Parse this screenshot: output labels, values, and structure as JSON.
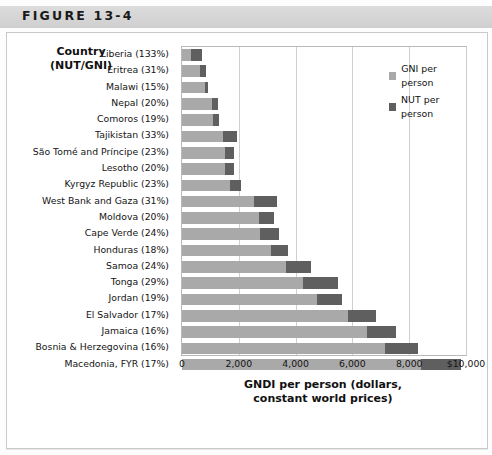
{
  "figure": {
    "label": "FIGURE 13-4"
  },
  "row_header": {
    "line1": "Country",
    "line2": "(NUT/GNI)"
  },
  "legend": {
    "items": [
      {
        "label": "GNI per person",
        "color": "#a9a9a9"
      },
      {
        "label": "NUT per person",
        "color": "#5f5f5f"
      }
    ]
  },
  "axis": {
    "title_line1": "GNDI per person (dollars,",
    "title_line2": "constant world prices)",
    "ticks": [
      "0",
      "2,000",
      "4,000",
      "6,000",
      "8,000",
      "$10,000"
    ]
  },
  "chart_data": {
    "type": "bar",
    "orientation": "horizontal",
    "stacked": true,
    "title": "FIGURE 13-4",
    "xlabel": "GNDI per person (dollars, constant world prices)",
    "ylabel": "Country (NUT/GNI)",
    "xlim": [
      0,
      10000
    ],
    "xticks": [
      0,
      2000,
      4000,
      6000,
      8000,
      10000
    ],
    "xticklabels": [
      "0",
      "2,000",
      "4,000",
      "6,000",
      "8,000",
      "$10,000"
    ],
    "grid": true,
    "legend_position": "top-right",
    "categories": [
      "Liberia (133%)",
      "Eritrea (31%)",
      "Malawi (15%)",
      "Nepal (20%)",
      "Comoros (19%)",
      "Tajikistan (33%)",
      "São Tomé and Príncipe (23%)",
      "Lesotho (20%)",
      "Kyrgyz Republic (23%)",
      "West Bank and Gaza (31%)",
      "Moldova (20%)",
      "Cape Verde (24%)",
      "Honduras (18%)",
      "Samoa (24%)",
      "Tonga (29%)",
      "Jordan (19%)",
      "El Salvador (17%)",
      "Jamaica (16%)",
      "Bosnia & Herzegovina (16%)",
      "Macedonia, FYR (17%)"
    ],
    "series": [
      {
        "name": "GNI per person",
        "color": "#a9a9a9",
        "values": [
          300,
          650,
          800,
          1050,
          1100,
          1450,
          1500,
          1500,
          1700,
          2550,
          2700,
          2750,
          3150,
          3650,
          4250,
          4750,
          5850,
          6500,
          7150,
          8400
        ]
      },
      {
        "name": "NUT per person",
        "color": "#5f5f5f",
        "values": [
          400,
          200,
          120,
          210,
          210,
          480,
          345,
          345,
          390,
          790,
          540,
          660,
          570,
          880,
          1230,
          900,
          995,
          1040,
          1145,
          1430
        ]
      }
    ]
  }
}
